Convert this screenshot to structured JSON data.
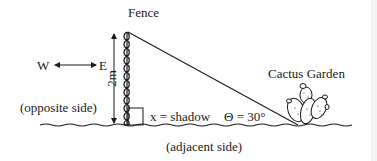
{
  "diagram": {
    "fence_label": "Fence",
    "direction": {
      "west": "W",
      "east": "E"
    },
    "height_label": "2m",
    "opposite_label": "(opposite side)",
    "shadow_label": "x = shadow",
    "angle_label": "Θ = 30°",
    "garden_label": "Cactus Garden",
    "adjacent_label": "(adjacent side)"
  },
  "colors": {
    "ink": "#1a1a1a",
    "background": "#ffffff",
    "edge_strip": "#f3f3f3"
  }
}
